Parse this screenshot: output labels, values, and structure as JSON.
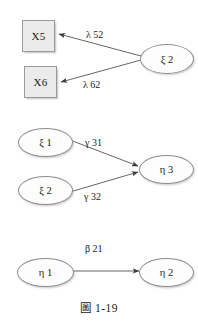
{
  "figure": {
    "caption": "圖 1-19",
    "background_color": "#ffffff",
    "box_fill_color": "#ebebeb",
    "box_border_color": "#9a9a9a",
    "ellipse_fill_color": "#fdfdfd",
    "ellipse_border_color": "#8d8d8d",
    "line_color": "#555555"
  },
  "panels": [
    {
      "id": "measurement-model",
      "nodes": [
        {
          "id": "x5",
          "label": "X5",
          "shape": "rect"
        },
        {
          "id": "x6",
          "label": "X6",
          "shape": "rect"
        },
        {
          "id": "xi2-top",
          "label": "ξ 2",
          "shape": "ellipse"
        }
      ],
      "edges": [
        {
          "from": "xi2-top",
          "to": "x5",
          "label": "λ 52"
        },
        {
          "from": "xi2-top",
          "to": "x6",
          "label": "λ 62"
        }
      ]
    },
    {
      "id": "structural-gamma",
      "nodes": [
        {
          "id": "xi1-mid",
          "label": "ξ 1",
          "shape": "ellipse"
        },
        {
          "id": "xi2-mid",
          "label": "ξ 2",
          "shape": "ellipse"
        },
        {
          "id": "eta3",
          "label": "η 3",
          "shape": "ellipse"
        }
      ],
      "edges": [
        {
          "from": "xi1-mid",
          "to": "eta3",
          "label": "γ 31"
        },
        {
          "from": "xi2-mid",
          "to": "eta3",
          "label": "γ 32"
        }
      ]
    },
    {
      "id": "structural-beta",
      "nodes": [
        {
          "id": "eta1",
          "label": "η 1",
          "shape": "ellipse"
        },
        {
          "id": "eta2",
          "label": "η 2",
          "shape": "ellipse"
        }
      ],
      "edges": [
        {
          "from": "eta1",
          "to": "eta2",
          "label": "β 21"
        }
      ]
    }
  ]
}
